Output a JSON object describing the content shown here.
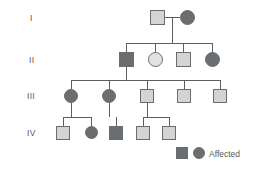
{
  "generation_labels": [
    {
      "text": "I",
      "x": 30,
      "y": 13
    },
    {
      "text": "II",
      "x": 29,
      "y": 55
    },
    {
      "text": "III",
      "x": 27,
      "y": 91
    },
    {
      "text": "IV",
      "x": 27,
      "y": 128
    }
  ],
  "legend": {
    "affected_label": "Affected",
    "square_name": "affected-male-key",
    "circle_name": "affected-female-key",
    "square": {
      "x": 176,
      "y": 147,
      "size": 12
    },
    "circle": {
      "x": 193,
      "y": 147,
      "size": 12
    },
    "text_x": 209,
    "text_y": 149
  },
  "colors": {
    "affected_fill": "#6b6e71",
    "unaffected_fill": "#d4d4d2",
    "unaffected_light_fill": "#e2e2df",
    "stroke": "#6a6d70",
    "line": "#5c5f62",
    "text": "#55585c",
    "background": "#ffffff"
  },
  "individuals": [
    {
      "id": "I-1",
      "generation": "I",
      "sex": "male",
      "affected": false,
      "x": 150,
      "y": 10,
      "size": 15
    },
    {
      "id": "I-2",
      "generation": "I",
      "sex": "female",
      "affected": true,
      "x": 180,
      "y": 10,
      "size": 15
    },
    {
      "id": "II-1",
      "generation": "II",
      "sex": "male",
      "affected": true,
      "x": 119,
      "y": 52,
      "size": 15
    },
    {
      "id": "II-2",
      "generation": "II",
      "sex": "female",
      "affected": false,
      "x": 148,
      "y": 52,
      "size": 15,
      "light": true
    },
    {
      "id": "II-3",
      "generation": "II",
      "sex": "male",
      "affected": false,
      "x": 176,
      "y": 52,
      "size": 15
    },
    {
      "id": "II-4",
      "generation": "II",
      "sex": "female",
      "affected": true,
      "x": 205,
      "y": 52,
      "size": 15
    },
    {
      "id": "III-1",
      "generation": "III",
      "sex": "female",
      "affected": true,
      "x": 64,
      "y": 89,
      "size": 14
    },
    {
      "id": "III-2",
      "generation": "III",
      "sex": "female",
      "affected": true,
      "x": 102,
      "y": 89,
      "size": 14
    },
    {
      "id": "III-3",
      "generation": "III",
      "sex": "male",
      "affected": false,
      "x": 140,
      "y": 89,
      "size": 14
    },
    {
      "id": "III-4",
      "generation": "III",
      "sex": "male",
      "affected": false,
      "x": 177,
      "y": 89,
      "size": 14
    },
    {
      "id": "III-5",
      "generation": "III",
      "sex": "male",
      "affected": false,
      "x": 213,
      "y": 89,
      "size": 14
    },
    {
      "id": "IV-1",
      "generation": "IV",
      "sex": "male",
      "affected": false,
      "x": 56,
      "y": 126,
      "size": 14
    },
    {
      "id": "IV-2",
      "generation": "IV",
      "sex": "female",
      "affected": true,
      "x": 85,
      "y": 126,
      "size": 13
    },
    {
      "id": "IV-3",
      "generation": "IV",
      "sex": "male",
      "affected": true,
      "x": 109,
      "y": 126,
      "size": 14
    },
    {
      "id": "IV-4",
      "generation": "IV",
      "sex": "male",
      "affected": false,
      "x": 136,
      "y": 126,
      "size": 14
    },
    {
      "id": "IV-5",
      "generation": "IV",
      "sex": "male",
      "affected": false,
      "x": 162,
      "y": 126,
      "size": 14
    }
  ],
  "lines": [
    {
      "name": "mating-line-gen1",
      "x1": 165,
      "y1": 17.5,
      "x2": 180,
      "y2": 17.5
    },
    {
      "name": "descent-line-gen1",
      "x1": 172.5,
      "y1": 17.5,
      "x2": 172.5,
      "y2": 43
    },
    {
      "name": "sibship-line-gen2",
      "x1": 126.5,
      "y1": 43,
      "x2": 212.5,
      "y2": 43
    },
    {
      "name": "drop-II-1",
      "x1": 126.5,
      "y1": 43,
      "x2": 126.5,
      "y2": 52
    },
    {
      "name": "drop-II-2",
      "x1": 155.5,
      "y1": 43,
      "x2": 155.5,
      "y2": 52
    },
    {
      "name": "drop-II-3",
      "x1": 183.5,
      "y1": 43,
      "x2": 183.5,
      "y2": 52
    },
    {
      "name": "drop-II-4",
      "x1": 212.5,
      "y1": 43,
      "x2": 212.5,
      "y2": 52
    },
    {
      "name": "descent-line-gen2",
      "x1": 126.5,
      "y1": 67,
      "x2": 126.5,
      "y2": 80
    },
    {
      "name": "sibship-line-gen3",
      "x1": 71,
      "y1": 80,
      "x2": 220,
      "y2": 80
    },
    {
      "name": "drop-III-1",
      "x1": 71,
      "y1": 80,
      "x2": 71,
      "y2": 89
    },
    {
      "name": "drop-III-2",
      "x1": 109,
      "y1": 80,
      "x2": 109,
      "y2": 89
    },
    {
      "name": "drop-III-3",
      "x1": 147,
      "y1": 80,
      "x2": 147,
      "y2": 89
    },
    {
      "name": "drop-III-4",
      "x1": 184,
      "y1": 80,
      "x2": 184,
      "y2": 89
    },
    {
      "name": "drop-III-5",
      "x1": 220,
      "y1": 80,
      "x2": 220,
      "y2": 89
    },
    {
      "name": "descent-line-III-1",
      "x1": 71,
      "y1": 103,
      "x2": 71,
      "y2": 117
    },
    {
      "name": "sibship-line-IV-a",
      "x1": 63,
      "y1": 117,
      "x2": 91.5,
      "y2": 117
    },
    {
      "name": "drop-IV-1",
      "x1": 63,
      "y1": 117,
      "x2": 63,
      "y2": 126
    },
    {
      "name": "drop-IV-2",
      "x1": 91.5,
      "y1": 117,
      "x2": 91.5,
      "y2": 126
    },
    {
      "name": "descent-line-III-2",
      "x1": 109,
      "y1": 103,
      "x2": 109,
      "y2": 117
    },
    {
      "name": "drop-IV-3",
      "x1": 116,
      "y1": 117,
      "x2": 116,
      "y2": 126
    },
    {
      "name": "descent-line-III-3",
      "x1": 147,
      "y1": 103,
      "x2": 147,
      "y2": 117
    },
    {
      "name": "sibship-line-IV-c",
      "x1": 143,
      "y1": 117,
      "x2": 169,
      "y2": 117
    },
    {
      "name": "drop-IV-4",
      "x1": 143,
      "y1": 117,
      "x2": 143,
      "y2": 126
    },
    {
      "name": "drop-IV-5",
      "x1": 169,
      "y1": 117,
      "x2": 169,
      "y2": 126
    }
  ]
}
